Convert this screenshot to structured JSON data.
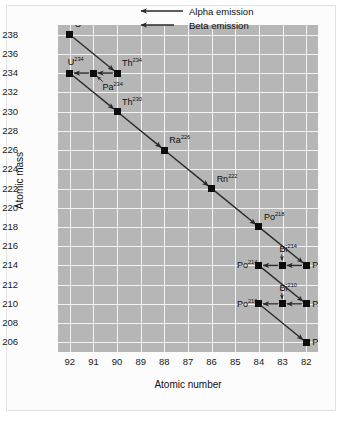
{
  "chart_data": {
    "type": "scatter",
    "title": "",
    "xlabel": "Atomic number",
    "ylabel": "Atomic mass",
    "xticks": [
      92,
      91,
      90,
      89,
      88,
      87,
      86,
      85,
      84,
      83,
      82
    ],
    "yticks": [
      238,
      236,
      234,
      232,
      230,
      228,
      226,
      224,
      222,
      220,
      218,
      216,
      214,
      212,
      210,
      208,
      206
    ],
    "xlim": [
      92.5,
      81.5
    ],
    "ylim": [
      205,
      239
    ],
    "grid": true,
    "legend_position": "top-right",
    "legend": [
      {
        "label": "Alpha emission",
        "arrow": "long"
      },
      {
        "label": "Beta emission",
        "arrow": "short"
      }
    ],
    "points": [
      {
        "element": "U",
        "mass": 238,
        "z": 92,
        "label_dx": 5,
        "label_dy": -11
      },
      {
        "element": "Th",
        "mass": 234,
        "z": 90,
        "label_dx": 5,
        "label_dy": -10
      },
      {
        "element": "Pa",
        "mass": 234,
        "z": 91,
        "label_dx": 9,
        "label_dy": 14
      },
      {
        "element": "U",
        "mass": 234,
        "z": 92,
        "label_dx": -2,
        "label_dy": -11
      },
      {
        "element": "Th",
        "mass": 230,
        "z": 90,
        "label_dx": 5,
        "label_dy": -10
      },
      {
        "element": "Ra",
        "mass": 226,
        "z": 88,
        "label_dx": 5,
        "label_dy": -10
      },
      {
        "element": "Rn",
        "mass": 222,
        "z": 86,
        "label_dx": 5,
        "label_dy": -10
      },
      {
        "element": "Po",
        "mass": 218,
        "z": 84,
        "label_dx": 5,
        "label_dy": -10
      },
      {
        "element": "Pb",
        "mass": 214,
        "z": 82,
        "label_dx": 6,
        "label_dy": 0
      },
      {
        "element": "Bi",
        "mass": 214,
        "z": 83,
        "label_dx": -3,
        "label_dy": -16
      },
      {
        "element": "Po",
        "mass": 214,
        "z": 84,
        "label_dx": -22,
        "label_dy": 0
      },
      {
        "element": "Pb",
        "mass": 210,
        "z": 82,
        "label_dx": 6,
        "label_dy": 0
      },
      {
        "element": "Bi",
        "mass": 210,
        "z": 83,
        "label_dx": -3,
        "label_dy": -16
      },
      {
        "element": "Po",
        "mass": 210,
        "z": 84,
        "label_dx": -22,
        "label_dy": 0
      },
      {
        "element": "Pb",
        "mass": 206,
        "z": 82,
        "label_dx": 6,
        "label_dy": 0
      }
    ],
    "decays": [
      {
        "from": {
          "z": 92,
          "mass": 238
        },
        "to": {
          "z": 90,
          "mass": 234
        },
        "type": "alpha"
      },
      {
        "from": {
          "z": 90,
          "mass": 234
        },
        "to": {
          "z": 91,
          "mass": 234
        },
        "type": "beta"
      },
      {
        "from": {
          "z": 91,
          "mass": 234
        },
        "to": {
          "z": 92,
          "mass": 234
        },
        "type": "beta"
      },
      {
        "from": {
          "z": 92,
          "mass": 234
        },
        "to": {
          "z": 90,
          "mass": 230
        },
        "type": "alpha"
      },
      {
        "from": {
          "z": 90,
          "mass": 230
        },
        "to": {
          "z": 88,
          "mass": 226
        },
        "type": "alpha"
      },
      {
        "from": {
          "z": 88,
          "mass": 226
        },
        "to": {
          "z": 86,
          "mass": 222
        },
        "type": "alpha"
      },
      {
        "from": {
          "z": 86,
          "mass": 222
        },
        "to": {
          "z": 84,
          "mass": 218
        },
        "type": "alpha"
      },
      {
        "from": {
          "z": 84,
          "mass": 218
        },
        "to": {
          "z": 82,
          "mass": 214
        },
        "type": "alpha"
      },
      {
        "from": {
          "z": 82,
          "mass": 214
        },
        "to": {
          "z": 83,
          "mass": 214
        },
        "type": "beta"
      },
      {
        "from": {
          "z": 83,
          "mass": 214
        },
        "to": {
          "z": 84,
          "mass": 214
        },
        "type": "beta"
      },
      {
        "from": {
          "z": 84,
          "mass": 214
        },
        "to": {
          "z": 82,
          "mass": 210
        },
        "type": "alpha"
      },
      {
        "from": {
          "z": 82,
          "mass": 210
        },
        "to": {
          "z": 83,
          "mass": 210
        },
        "type": "beta"
      },
      {
        "from": {
          "z": 83,
          "mass": 210
        },
        "to": {
          "z": 84,
          "mass": 210
        },
        "type": "beta"
      },
      {
        "from": {
          "z": 84,
          "mass": 210
        },
        "to": {
          "z": 82,
          "mass": 206
        },
        "type": "alpha"
      }
    ],
    "pointer_lines": [
      {
        "label_for": {
          "element": "Pa",
          "mass": 234,
          "z": 91
        }
      },
      {
        "label_for": {
          "element": "Bi",
          "mass": 214,
          "z": 83
        }
      },
      {
        "label_for": {
          "element": "Bi",
          "mass": 210,
          "z": 83
        }
      }
    ]
  },
  "colors": {
    "plot_background": "#b6b6b6",
    "gridline": "#f2f2f2",
    "marker": "#0d0d0d",
    "arrow": "#2a2a2a",
    "text": "#111111",
    "page_background": "#ffffff"
  }
}
